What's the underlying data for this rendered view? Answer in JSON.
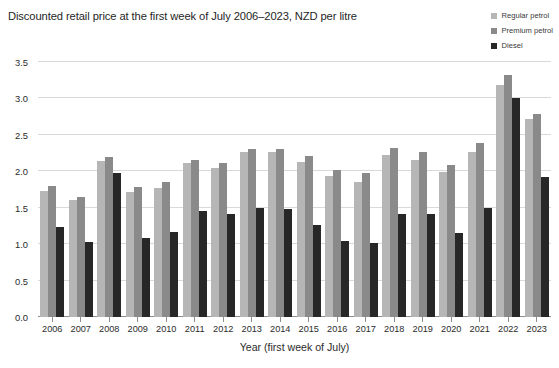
{
  "chart_data": {
    "type": "bar",
    "title": "Discounted retail price at the first week of July 2006–2023, NZD per litre",
    "xlabel": "Year (first week of July)",
    "ylabel": "",
    "ylim": [
      0,
      3.5
    ],
    "yticks": [
      "0.0",
      "0.5",
      "1.0",
      "1.5",
      "2.0",
      "2.5",
      "3.0",
      "3.5"
    ],
    "ytick_values": [
      0,
      0.5,
      1.0,
      1.5,
      2.0,
      2.5,
      3.0,
      3.5
    ],
    "grid": true,
    "legend_position": "top-right",
    "categories": [
      "2006",
      "2007",
      "2008",
      "2009",
      "2010",
      "2011",
      "2012",
      "2013",
      "2014",
      "2015",
      "2016",
      "2017",
      "2018",
      "2019",
      "2020",
      "2021",
      "2022",
      "2023"
    ],
    "series": [
      {
        "name": "Regular petrol",
        "color": "#b6b6b6",
        "values": [
          1.73,
          1.6,
          2.14,
          1.71,
          1.77,
          2.11,
          2.04,
          2.26,
          2.27,
          2.13,
          1.94,
          1.86,
          2.22,
          2.16,
          1.99,
          2.27,
          3.19,
          2.72
        ]
      },
      {
        "name": "Premium petrol",
        "color": "#8a8a8a",
        "values": [
          1.8,
          1.65,
          2.2,
          1.79,
          1.86,
          2.16,
          2.11,
          2.3,
          2.3,
          2.21,
          2.02,
          1.97,
          2.32,
          2.26,
          2.09,
          2.39,
          3.32,
          2.79
        ]
      },
      {
        "name": "Diesel",
        "color": "#272727",
        "values": [
          1.24,
          1.03,
          1.98,
          1.08,
          1.17,
          1.45,
          1.41,
          1.49,
          1.48,
          1.26,
          1.05,
          1.02,
          1.42,
          1.41,
          1.16,
          1.49,
          3.01,
          1.92
        ]
      }
    ]
  },
  "colors": {
    "regular": "#b6b6b6",
    "premium": "#8a8a8a",
    "diesel": "#272727",
    "grid": "#d9d9d9",
    "axis": "#8d8d8d",
    "text": "#2b2b2b",
    "background": "#ffffff"
  }
}
